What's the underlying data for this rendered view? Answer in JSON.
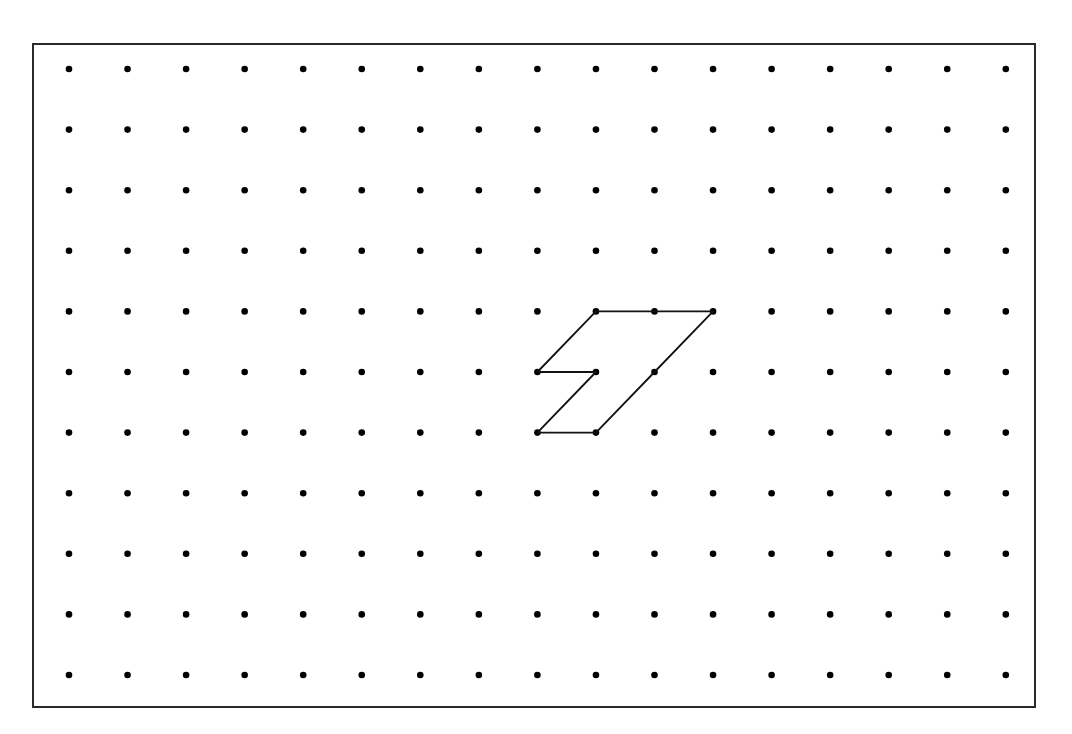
{
  "caption": {
    "text": ""
  },
  "grid": {
    "columns": 17,
    "rows": 11,
    "origin_x": 69,
    "origin_y": 69,
    "spacing_x": 58.55,
    "spacing_y": 60.6,
    "dot_radius": 3.3,
    "dot_color": "#000000"
  },
  "shape": {
    "name": "seven-shaped polygon",
    "stroke_color": "#111111",
    "stroke_width": 1.8,
    "vertices": [
      [
        9,
        4
      ],
      [
        10,
        4
      ],
      [
        11,
        4
      ],
      [
        10,
        5
      ],
      [
        9,
        6
      ],
      [
        8,
        6
      ],
      [
        9,
        5
      ],
      [
        8,
        5
      ]
    ]
  }
}
